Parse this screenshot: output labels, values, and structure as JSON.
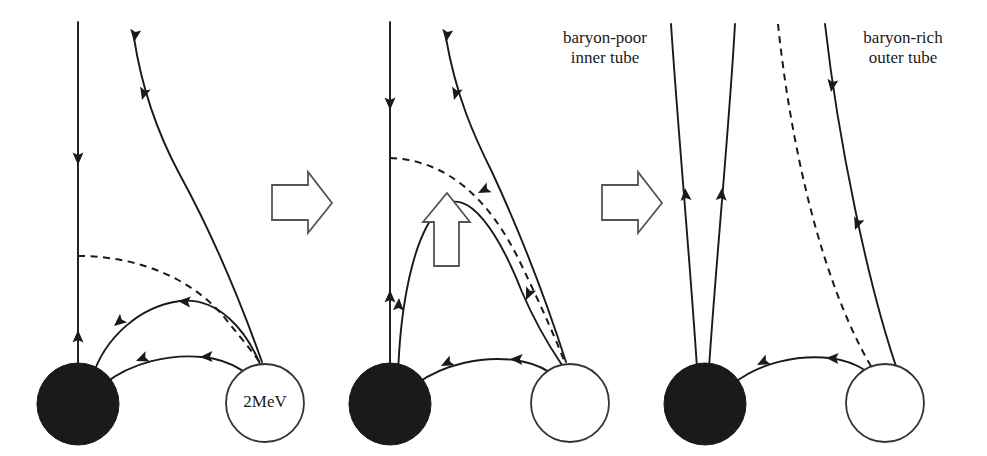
{
  "figure": {
    "width": 987,
    "height": 456,
    "background_color": "#ffffff",
    "line_color": "#1a1a1a",
    "filled_star_color": "#1a1a1a",
    "open_star_fill": "#ffffff",
    "open_star_stroke": "#333333"
  },
  "labels": {
    "energy_tag": "2MeV",
    "inner_tube_line1": "baryon-poor",
    "inner_tube_line2": "inner tube",
    "outer_tube_line1": "baryon-rich",
    "outer_tube_line2": "outer tube"
  },
  "panels": [
    {
      "id": "panel-1",
      "name": "initial-configuration",
      "filled_star": {
        "cx": 78,
        "cy": 404,
        "r": 41
      },
      "open_star": {
        "cx": 265,
        "cy": 403,
        "r": 39
      },
      "open_star_label": "2MeV",
      "open_field_line_x": 78,
      "description": "Open vertical field line with upward flow; closed loops connect the two stars; one dashed separatrix loop."
    },
    {
      "id": "panel-2",
      "name": "rising-loop",
      "filled_star": {
        "cx": 390,
        "cy": 404,
        "r": 41
      },
      "open_star": {
        "cx": 570,
        "cy": 403,
        "r": 39
      },
      "open_star_label": "",
      "open_field_line_x": 390,
      "description": "Inner loop has expanded upward; a hollow up arrow marks the rise."
    },
    {
      "id": "panel-3",
      "name": "opened-tubes",
      "filled_star": {
        "cx": 705,
        "cy": 404,
        "r": 41
      },
      "open_star": {
        "cx": 885,
        "cy": 403,
        "r": 39
      },
      "open_star_label": "",
      "open_field_line_x": 705,
      "description": "Field lines have opened into two nearly radial tubes: baryon-poor inner tube and baryon-rich outer tube."
    }
  ],
  "transitions": [
    {
      "id": "arrow-1-2",
      "name": "evolution-arrow-first",
      "direction": "right",
      "x": 270,
      "y": 168
    },
    {
      "id": "arrow-2-3",
      "name": "evolution-arrow-second",
      "direction": "right",
      "x": 600,
      "y": 168
    }
  ],
  "annotations": [
    {
      "id": "rise-arrow",
      "name": "loop-rise-arrow",
      "direction": "up",
      "x": 425,
      "y": 195
    }
  ]
}
